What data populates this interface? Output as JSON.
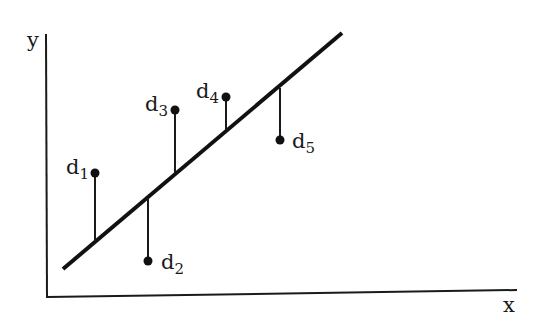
{
  "axes": {
    "x_label": "x",
    "y_label": "y",
    "color": "#1a1a1a"
  },
  "regression_line": {
    "x1": 63,
    "y1": 269,
    "x2": 342,
    "y2": 33
  },
  "points": [
    {
      "name": "d",
      "sub": "1",
      "px": 95,
      "py": 173,
      "foot_y": 241,
      "label_x": 66,
      "label_y": 157
    },
    {
      "name": "d",
      "sub": "2",
      "px": 148,
      "py": 261,
      "foot_y": 198,
      "label_x": 161,
      "label_y": 252
    },
    {
      "name": "d",
      "sub": "3",
      "px": 175,
      "py": 110,
      "foot_y": 173,
      "label_x": 145,
      "label_y": 94
    },
    {
      "name": "d",
      "sub": "4",
      "px": 226,
      "py": 97,
      "foot_y": 130,
      "label_x": 196,
      "label_y": 81
    },
    {
      "name": "d",
      "sub": "5",
      "px": 280,
      "py": 140,
      "foot_y": 88,
      "label_x": 292,
      "label_y": 131
    }
  ],
  "chart_data": {
    "type": "scatter",
    "title": "",
    "xlabel": "x",
    "ylabel": "y",
    "series": [
      {
        "name": "data points",
        "labels": [
          "d1",
          "d2",
          "d3",
          "d4",
          "d5"
        ],
        "x": [
          95,
          148,
          175,
          226,
          280
        ],
        "y": [
          159,
          71,
          222,
          235,
          192
        ]
      },
      {
        "name": "fitted line",
        "type": "line",
        "x": [
          63,
          342
        ],
        "y": [
          63,
          299
        ]
      }
    ],
    "residuals": [
      {
        "label": "d1",
        "direction": "above line"
      },
      {
        "label": "d2",
        "direction": "below line"
      },
      {
        "label": "d3",
        "direction": "above line"
      },
      {
        "label": "d4",
        "direction": "above line"
      },
      {
        "label": "d5",
        "direction": "below line"
      }
    ],
    "grid": false,
    "legend": "none",
    "note": "Coordinates are pixel-based (y inverted to math orientation); no axis ticks shown"
  }
}
